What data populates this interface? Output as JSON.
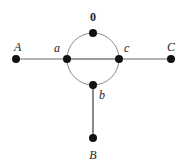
{
  "diagram": {
    "type": "graph",
    "width": 185,
    "height": 164,
    "colors": {
      "node": "#111111",
      "edge": "#6a6a6a",
      "arc": "#8a8a8a",
      "label": "#222222",
      "background": "#ffffff"
    },
    "circle": {
      "cx": 93,
      "cy": 59,
      "r": 26
    },
    "nodes": [
      {
        "id": "A",
        "label": "A",
        "x": 16,
        "y": 59
      },
      {
        "id": "a",
        "label": "a",
        "x": 67,
        "y": 59
      },
      {
        "id": "c",
        "label": "c",
        "x": 119,
        "y": 59
      },
      {
        "id": "C",
        "label": "C",
        "x": 171,
        "y": 59
      },
      {
        "id": "0",
        "label": "0",
        "x": 93,
        "y": 33
      },
      {
        "id": "b",
        "label": "b",
        "x": 93,
        "y": 85
      },
      {
        "id": "B",
        "label": "B",
        "x": 93,
        "y": 138
      }
    ],
    "edges": [
      {
        "from": "A",
        "to": "a",
        "kind": "straight"
      },
      {
        "from": "a",
        "to": "c",
        "kind": "straight"
      },
      {
        "from": "c",
        "to": "C",
        "kind": "straight"
      },
      {
        "from": "b",
        "to": "B",
        "kind": "straight"
      },
      {
        "from": "a",
        "to": "0",
        "kind": "arc"
      },
      {
        "from": "0",
        "to": "c",
        "kind": "arc"
      },
      {
        "from": "c",
        "to": "b",
        "kind": "arc"
      },
      {
        "from": "b",
        "to": "a",
        "kind": "arc"
      }
    ],
    "labels": {
      "A": "A",
      "a": "a",
      "c": "c",
      "C": "C",
      "zero": "0",
      "b": "b",
      "B": "B"
    }
  }
}
